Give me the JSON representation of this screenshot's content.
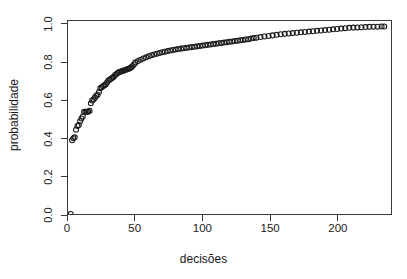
{
  "chart_data": {
    "type": "scatter",
    "title": "",
    "xlabel": "decisões",
    "ylabel": "probabilidade",
    "xlim": [
      0,
      240
    ],
    "ylim": [
      0.0,
      1.02
    ],
    "grid": false,
    "legend": null,
    "marker": "open-circle",
    "marker_color": "#1a1a1a",
    "xticks": [
      0,
      50,
      100,
      150,
      200
    ],
    "xtick_labels": [
      "0",
      "50",
      "100",
      "150",
      "200"
    ],
    "yticks": [
      0.0,
      0.2,
      0.4,
      0.6,
      0.8,
      1.0
    ],
    "ytick_labels": [
      "0.0",
      "0.2",
      "0.4",
      "0.6",
      "0.8",
      "1.0"
    ],
    "series": [
      {
        "name": "probabilidade acumulada",
        "x": [
          2,
          3,
          4,
          5,
          6,
          7,
          8,
          9,
          10,
          11,
          12,
          13,
          14,
          15,
          16,
          17,
          18,
          19,
          20,
          21,
          22,
          23,
          24,
          25,
          26,
          27,
          28,
          29,
          30,
          31,
          32,
          33,
          34,
          35,
          36,
          37,
          38,
          39,
          40,
          41,
          42,
          43,
          44,
          45,
          46,
          47,
          48,
          49,
          50,
          52,
          54,
          56,
          58,
          60,
          62,
          64,
          66,
          68,
          70,
          72,
          74,
          76,
          78,
          80,
          82,
          84,
          86,
          88,
          90,
          92,
          94,
          96,
          98,
          100,
          102,
          104,
          106,
          108,
          110,
          112,
          114,
          116,
          118,
          120,
          122,
          124,
          126,
          128,
          130,
          132,
          134,
          136,
          138,
          140,
          143,
          146,
          149,
          152,
          155,
          158,
          161,
          164,
          167,
          170,
          173,
          176,
          179,
          182,
          185,
          188,
          191,
          194,
          197,
          200,
          203,
          206,
          209,
          212,
          215,
          218,
          221,
          224,
          227,
          230,
          233,
          235
        ],
        "y": [
          0.0,
          0.39,
          0.4,
          0.405,
          0.445,
          0.465,
          0.47,
          0.49,
          0.505,
          0.515,
          0.54,
          0.54,
          0.54,
          0.54,
          0.545,
          0.585,
          0.6,
          0.605,
          0.615,
          0.625,
          0.63,
          0.645,
          0.665,
          0.67,
          0.675,
          0.68,
          0.685,
          0.695,
          0.705,
          0.71,
          0.715,
          0.72,
          0.725,
          0.735,
          0.74,
          0.745,
          0.75,
          0.752,
          0.755,
          0.757,
          0.76,
          0.762,
          0.765,
          0.768,
          0.77,
          0.775,
          0.782,
          0.79,
          0.8,
          0.808,
          0.815,
          0.822,
          0.828,
          0.834,
          0.839,
          0.843,
          0.847,
          0.851,
          0.855,
          0.858,
          0.861,
          0.864,
          0.867,
          0.869,
          0.872,
          0.874,
          0.876,
          0.878,
          0.88,
          0.882,
          0.884,
          0.886,
          0.888,
          0.89,
          0.892,
          0.894,
          0.896,
          0.898,
          0.9,
          0.902,
          0.904,
          0.906,
          0.908,
          0.91,
          0.912,
          0.914,
          0.916,
          0.918,
          0.92,
          0.922,
          0.924,
          0.927,
          0.93,
          0.932,
          0.935,
          0.938,
          0.941,
          0.944,
          0.947,
          0.95,
          0.952,
          0.954,
          0.956,
          0.958,
          0.96,
          0.962,
          0.964,
          0.966,
          0.968,
          0.97,
          0.972,
          0.974,
          0.976,
          0.978,
          0.98,
          0.982,
          0.984,
          0.985,
          0.986,
          0.987,
          0.988,
          0.989,
          0.99,
          0.99,
          0.991,
          0.991
        ]
      }
    ]
  }
}
